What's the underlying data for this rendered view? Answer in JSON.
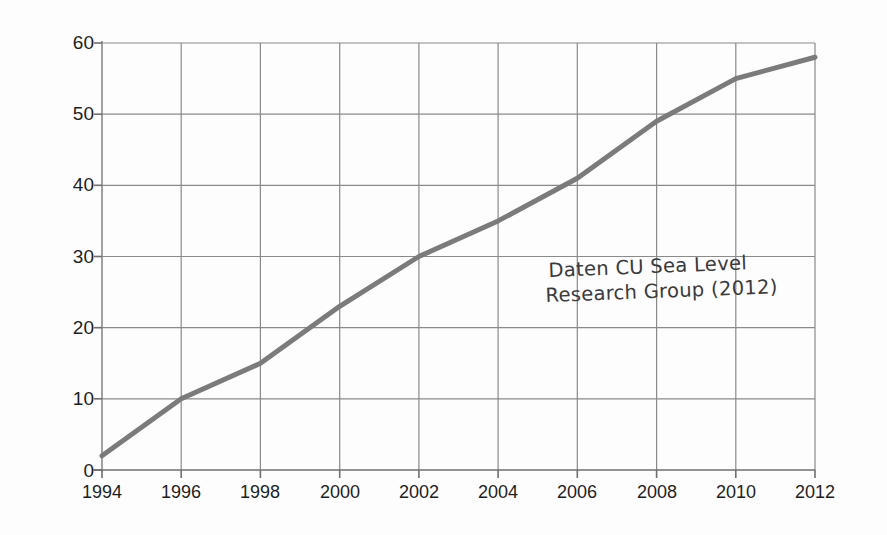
{
  "figure": {
    "name": "sea-level-rise-line-chart",
    "background_color": "#fdfdfd",
    "annotation": {
      "line1": "Daten CU Sea Level",
      "line2": "Research Group (2012)"
    }
  },
  "chart_data": {
    "type": "line",
    "title": "",
    "subtitle": "",
    "xlabel": "",
    "ylabel": "Erhöhung Meeresspiegel in mm",
    "x": [
      1994,
      1996,
      1998,
      2000,
      2002,
      2004,
      2006,
      2008,
      2010,
      2012
    ],
    "series": [
      {
        "name": "Erhöhung Meeresspiegel",
        "color": "#7b7b7b",
        "line_width": 5,
        "values": [
          2,
          10,
          15,
          23,
          30,
          35,
          41,
          49,
          55,
          58
        ]
      }
    ],
    "xticks": [
      "1994",
      "1996",
      "1998",
      "2000",
      "2002",
      "2004",
      "2006",
      "2008",
      "2010",
      "2012"
    ],
    "yticks": [
      "0",
      "10",
      "20",
      "30",
      "40",
      "50",
      "60"
    ],
    "xlim": [
      1994,
      2012
    ],
    "ylim": [
      0,
      60
    ],
    "grid": true,
    "grid_color": "#8a8a8a",
    "legend": false,
    "legend_position": "none"
  }
}
